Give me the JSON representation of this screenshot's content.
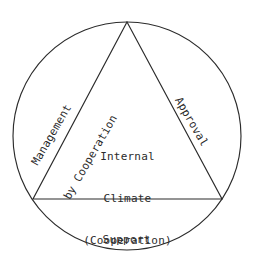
{
  "diagram": {
    "type": "circle-with-inscribed-triangle",
    "geometry": {
      "circle": {
        "cx": 127,
        "cy": 136,
        "r": 114
      },
      "triangle": {
        "apex": {
          "x": 127,
          "y": 22
        },
        "bottom_left": {
          "x": 33,
          "y": 199
        },
        "bottom_right": {
          "x": 222,
          "y": 199
        }
      }
    },
    "center_label": {
      "lines": [
        "Internal",
        "Climate",
        "(Cooperation)"
      ]
    },
    "edges": [
      {
        "position": "left",
        "name": "management-by-cooperation",
        "lines": [
          "Management",
          "by Cooperation"
        ],
        "rotation_deg": -60
      },
      {
        "position": "right",
        "name": "approval",
        "lines": [
          "Approval"
        ],
        "rotation_deg": 60
      },
      {
        "position": "bottom",
        "name": "support",
        "lines": [
          "Support"
        ],
        "rotation_deg": 0
      }
    ],
    "bottom_clipped_text": "",
    "colors": {
      "stroke": "#2b2b2b",
      "text": "#2b2b2b",
      "background": "#ffffff"
    }
  }
}
